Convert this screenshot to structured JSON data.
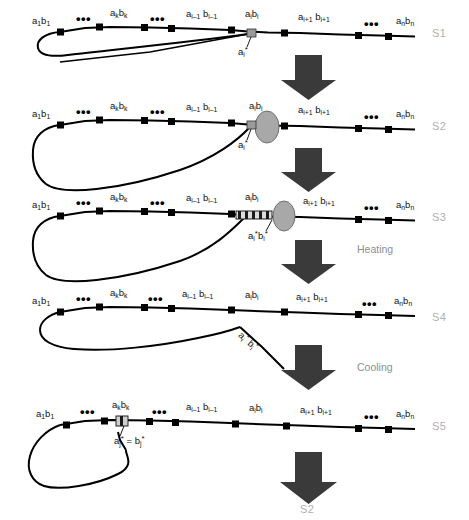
{
  "figure": {
    "title_fragment": "",
    "strand_labels": [
      "S1",
      "S2",
      "S3",
      "S4",
      "S5",
      "S2"
    ],
    "process_labels": {
      "heating": "Heating",
      "cooling": "Cooling"
    },
    "ellipsis": "•••",
    "colors": {
      "strand_line": "#000000",
      "node_fill": "#000000",
      "ellipse_fill": "#a8a8a8",
      "ellipse_stroke": "#5a5a5a",
      "duplex_fill": "#8f8f8f",
      "arrow_fill": "#3a3a3a",
      "stage_label": "#b0b0b0",
      "process_text": "#8e8e8e"
    }
  },
  "rows": [
    {
      "id": "S1",
      "stage_label": "S1",
      "node_labels": [
        {
          "id": "a1b1",
          "a": "a",
          "asub": "1",
          "b": "b",
          "bsub": "1"
        },
        {
          "id": "akbk",
          "a": "a",
          "asub": "k",
          "b": "b",
          "bsub": "k"
        },
        {
          "id": "ai-1bi-1",
          "a": "a",
          "asub": "i–1",
          "b": "b",
          "bsub": "i–1"
        },
        {
          "id": "aibi",
          "a": "a",
          "asub": "i",
          "b": "b",
          "bsub": "i"
        },
        {
          "id": "ai+1bi+1",
          "a": "a",
          "asub": "i+1",
          "b": "b",
          "bsub": "i+1"
        },
        {
          "id": "anbn",
          "a": "a",
          "asub": "n",
          "b": "b",
          "bsub": "n"
        }
      ],
      "annotation": {
        "text": "a",
        "sub": "i",
        "star": "*"
      }
    },
    {
      "id": "S2",
      "stage_label": "S2",
      "node_labels": [
        {
          "id": "a1b1",
          "a": "a",
          "asub": "1",
          "b": "b",
          "bsub": "1"
        },
        {
          "id": "akbk",
          "a": "a",
          "asub": "k",
          "b": "b",
          "bsub": "k"
        },
        {
          "id": "ai-1bi-1",
          "a": "a",
          "asub": "i–1",
          "b": "b",
          "bsub": "i–1"
        },
        {
          "id": "aibi",
          "a": "a",
          "asub": "i",
          "b": "b",
          "bsub": "i"
        },
        {
          "id": "ai+1bi+1",
          "a": "a",
          "asub": "i+1",
          "b": "b",
          "bsub": "i+1"
        },
        {
          "id": "anbn",
          "a": "a",
          "asub": "n",
          "b": "b",
          "bsub": "n"
        }
      ],
      "annotation": {
        "text": "a",
        "sub": "i",
        "star": "*"
      }
    },
    {
      "id": "S3",
      "stage_label": "S3",
      "node_labels": [
        {
          "id": "a1b1",
          "a": "a",
          "asub": "1",
          "b": "b",
          "bsub": "1"
        },
        {
          "id": "akbk",
          "a": "a",
          "asub": "k",
          "b": "b",
          "bsub": "k"
        },
        {
          "id": "ai-1bi-1",
          "a": "a",
          "asub": "i–1",
          "b": "b",
          "bsub": "i–1"
        },
        {
          "id": "aibi",
          "a": "a",
          "asub": "i",
          "b": "b",
          "bsub": "i"
        },
        {
          "id": "ai+1bi+1",
          "a": "a",
          "asub": "i+1",
          "b": "b",
          "bsub": "i+1"
        },
        {
          "id": "anbn",
          "a": "a",
          "asub": "n",
          "b": "b",
          "bsub": "n"
        }
      ],
      "annotation_duplex": {
        "a": "a",
        "asub": "i",
        "astar": "*",
        "b": "b",
        "bsub": "i",
        "bstar": "*"
      }
    },
    {
      "id": "S4",
      "stage_label": "S4",
      "node_labels": [
        {
          "id": "a1b1",
          "a": "a",
          "asub": "1",
          "b": "b",
          "bsub": "1"
        },
        {
          "id": "akbk",
          "a": "a",
          "asub": "k",
          "b": "b",
          "bsub": "k"
        },
        {
          "id": "ai-1bi-1",
          "a": "a",
          "asub": "i–1",
          "b": "b",
          "bsub": "i–1"
        },
        {
          "id": "aibi",
          "a": "a",
          "asub": "i",
          "b": "b",
          "bsub": "i"
        },
        {
          "id": "ai+1bi+1",
          "a": "a",
          "asub": "i+1",
          "b": "b",
          "bsub": "i+1"
        },
        {
          "id": "anbn",
          "a": "a",
          "asub": "n",
          "b": "b",
          "bsub": "n"
        }
      ],
      "annotation_tail": {
        "a": "a",
        "asub": "i",
        "astar": "*",
        "b": "b",
        "bsub": "i",
        "bstar": "*"
      }
    },
    {
      "id": "S5",
      "stage_label": "S5",
      "node_labels": [
        {
          "id": "a1b1",
          "a": "a",
          "asub": "1",
          "b": "b",
          "bsub": "1"
        },
        {
          "id": "akbk",
          "a": "a",
          "asub": "k",
          "b": "b",
          "bsub": "k"
        },
        {
          "id": "ai-1bi-1",
          "a": "a",
          "asub": "i–1",
          "b": "b",
          "bsub": "i–1"
        },
        {
          "id": "aibi",
          "a": "a",
          "asub": "i",
          "b": "b",
          "bsub": "i"
        },
        {
          "id": "ai+1bi+1",
          "a": "a",
          "asub": "i+1",
          "b": "b",
          "bsub": "i+1"
        },
        {
          "id": "anbn",
          "a": "a",
          "asub": "n",
          "b": "b",
          "bsub": "n"
        }
      ],
      "annotation_equal": {
        "a": "a",
        "asub": "j",
        "astar": "*",
        "eq": "=",
        "b": "b",
        "bsub": "j",
        "bstar": "*"
      }
    }
  ]
}
